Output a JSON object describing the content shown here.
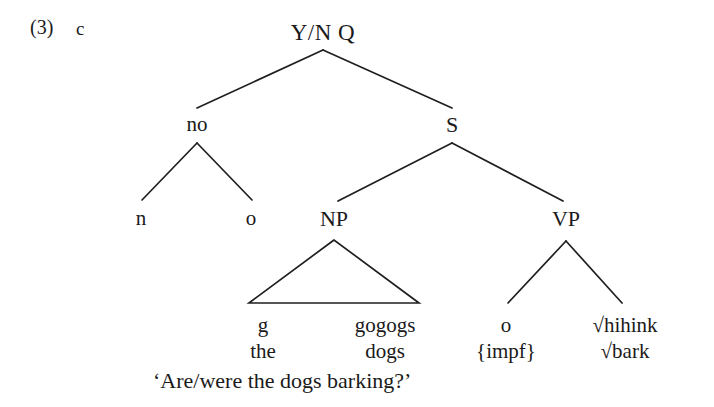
{
  "figure": {
    "example_number": "(3)",
    "example_letter": "c",
    "translation": "‘Are/were the dogs barking?’",
    "background_color": "#ffffff",
    "line_color": "#1f1f1f",
    "text_color": "#1a1a1a"
  },
  "tree": {
    "root": {
      "label": "Y/N Q",
      "x": 323,
      "y": 20
    },
    "nodes": [
      {
        "id": "no",
        "label": "no",
        "x": 197,
        "y": 112
      },
      {
        "id": "s",
        "label": "S",
        "x": 452,
        "y": 112
      },
      {
        "id": "n",
        "label": "n",
        "x": 141,
        "y": 206
      },
      {
        "id": "o_neg",
        "label": "o",
        "x": 251,
        "y": 206
      },
      {
        "id": "np",
        "label": "NP",
        "x": 334,
        "y": 206
      },
      {
        "id": "vp",
        "label": "VP",
        "x": 566,
        "y": 206
      }
    ],
    "leaves": [
      {
        "id": "det",
        "morph": "g",
        "gloss": "the",
        "x": 263
      },
      {
        "id": "noun",
        "morph": "gogogs",
        "gloss": "dogs",
        "x": 385
      },
      {
        "id": "aspect",
        "morph": "o",
        "gloss": "{impf}",
        "x": 506
      },
      {
        "id": "verb",
        "morph": "√hihink",
        "gloss": "√bark",
        "x": 625
      }
    ],
    "triangle": {
      "apex_x": 334,
      "apex_y": 240,
      "left_x": 249,
      "right_x": 419,
      "base_y": 303
    },
    "edges": [
      {
        "from": "root",
        "to": "no",
        "x1": 323,
        "y1": 50,
        "x2": 197,
        "y2": 108
      },
      {
        "from": "root",
        "to": "s",
        "x1": 323,
        "y1": 50,
        "x2": 452,
        "y2": 108
      },
      {
        "from": "no",
        "to": "n",
        "x1": 197,
        "y1": 143,
        "x2": 142,
        "y2": 200
      },
      {
        "from": "no",
        "to": "o_neg",
        "x1": 197,
        "y1": 143,
        "x2": 252,
        "y2": 200
      },
      {
        "from": "s",
        "to": "np",
        "x1": 452,
        "y1": 143,
        "x2": 338,
        "y2": 201
      },
      {
        "from": "s",
        "to": "vp",
        "x1": 452,
        "y1": 143,
        "x2": 563,
        "y2": 201
      },
      {
        "from": "vp",
        "to": "aspect",
        "x1": 566,
        "y1": 241,
        "x2": 508,
        "y2": 303
      },
      {
        "from": "vp",
        "to": "verb",
        "x1": 566,
        "y1": 241,
        "x2": 622,
        "y2": 303
      }
    ],
    "rows": {
      "morph_y": 313,
      "gloss_y": 339,
      "translation_y": 368,
      "translation_x": 153
    }
  }
}
